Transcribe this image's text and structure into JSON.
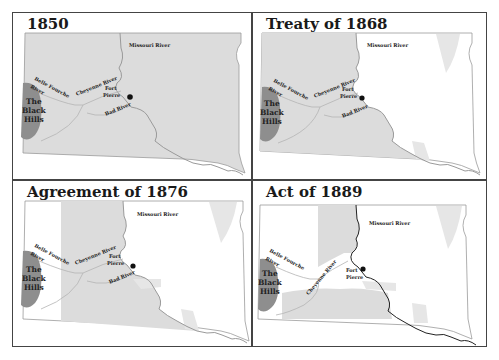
{
  "figure": {
    "colors": {
      "shaded": "#dcdcdc",
      "unshaded": "#ffffff",
      "black_hills": "#8e8e8e",
      "border": "#9a9a9a",
      "river": "#b4b4b4",
      "missouri_1889": "#222222",
      "frame": "#444444"
    },
    "panels": [
      {
        "title": "1850",
        "labels": {
          "missouri": "Missouri River",
          "belle_fourche_1": "Belle Fourche",
          "belle_fourche_2": "River",
          "cheyenne": "Cheyenne River",
          "fort_1": "Fort",
          "fort_2": "Pierre",
          "bad": "Bad River",
          "bh_1": "The",
          "bh_2": "Black",
          "bh_3": "Hills"
        }
      },
      {
        "title": "Treaty of 1868",
        "labels": {
          "missouri": "Missouri River",
          "belle_fourche_1": "Belle Fourche",
          "belle_fourche_2": "River",
          "cheyenne": "Cheyenne River",
          "fort_1": "Fort",
          "fort_2": "Pierre",
          "bad": "Bad River",
          "bh_1": "The",
          "bh_2": "Black",
          "bh_3": "Hills"
        }
      },
      {
        "title": "Agreement of 1876",
        "labels": {
          "missouri": "Missouri River",
          "belle_fourche_1": "Belle Fourche",
          "belle_fourche_2": "River",
          "cheyenne": "Cheyenne River",
          "fort_1": "Fort",
          "fort_2": "Pierre",
          "bad": "Bad River",
          "bh_1": "The",
          "bh_2": "Black",
          "bh_3": "Hills"
        }
      },
      {
        "title": "Act of 1889",
        "labels": {
          "missouri": "Missouri River",
          "belle_fourche_1": "Belle Fourche",
          "belle_fourche_2": "River",
          "cheyenne": "Cheyenne River",
          "fort_1": "Fort",
          "fort_2": "Pierre",
          "bh_1": "The",
          "bh_2": "Black",
          "bh_3": "Hills"
        }
      }
    ],
    "caption_partial": ""
  }
}
